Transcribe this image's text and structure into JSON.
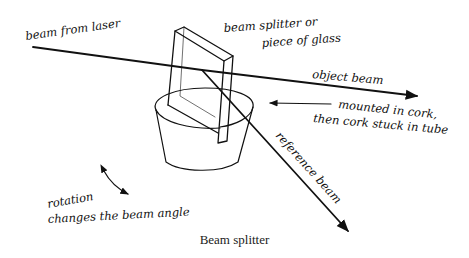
{
  "figure": {
    "caption": "Beam splitter",
    "labels": {
      "beam_from_laser": "beam from laser",
      "splitter_line1": "beam splitter or",
      "splitter_line2": "piece of glass",
      "object_beam": "object beam",
      "mount_line1": "mounted in cork,",
      "mount_line2": "then cork stuck in tube",
      "reference_beam": "reference beam",
      "rotation_line1": "rotation",
      "rotation_line2": "changes the beam angle"
    },
    "colors": {
      "ink": "#111111",
      "background": "#ffffff"
    }
  }
}
